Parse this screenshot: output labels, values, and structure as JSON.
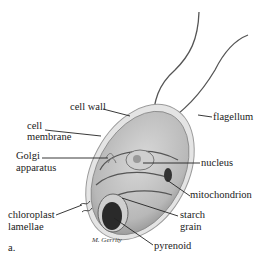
{
  "figure": {
    "panel_label": "a.",
    "signature": "M. Gerrity"
  },
  "labels": {
    "cell_wall": "cell wall",
    "cell_membrane_1": "cell",
    "cell_membrane_2": "membrane",
    "golgi_1": "Golgi",
    "golgi_2": "apparatus",
    "chloroplast_1": "chloroplast",
    "chloroplast_2": "lamellae",
    "flagellum": "flagellum",
    "nucleus": "nucleus",
    "mitochondrion": "mitochondrion",
    "starch_1": "starch",
    "starch_2": "grain",
    "pyrenoid": "pyrenoid"
  },
  "colors": {
    "background": "#ffffff",
    "cell_body": "#c9c9c9",
    "cell_wall": "#e2e2e2",
    "leader_line": "#222222",
    "pyrenoid": "#2a2a2a"
  }
}
